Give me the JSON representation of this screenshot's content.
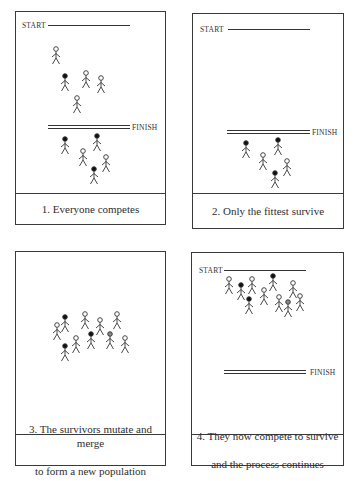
{
  "labels": {
    "start": "START",
    "finish": "FINISH"
  },
  "panels": [
    {
      "caption": "1. Everyone competes",
      "box": {
        "x": 15,
        "y": 11,
        "w": 151,
        "h": 214
      },
      "caption_top": 181,
      "start": {
        "x": 22,
        "y": 21,
        "line_x1": 48,
        "line_x2": 130,
        "line_y": 25
      },
      "finish": {
        "x": 132,
        "y": 123,
        "line_x1": 48,
        "line_x2": 130,
        "line_y": 125
      },
      "figures": [
        {
          "x": 56,
          "y": 49,
          "head": "open"
        },
        {
          "x": 65,
          "y": 76,
          "head": "filled"
        },
        {
          "x": 86,
          "y": 73,
          "head": "open"
        },
        {
          "x": 101,
          "y": 78,
          "head": "open"
        },
        {
          "x": 77,
          "y": 98,
          "head": "open"
        },
        {
          "x": 65,
          "y": 139,
          "head": "filled"
        },
        {
          "x": 97,
          "y": 136,
          "head": "filled"
        },
        {
          "x": 83,
          "y": 151,
          "head": "open"
        },
        {
          "x": 106,
          "y": 157,
          "head": "open"
        },
        {
          "x": 94,
          "y": 169,
          "head": "filled"
        }
      ]
    },
    {
      "caption": "2. Only the fittest survive",
      "box": {
        "x": 192,
        "y": 13,
        "w": 152,
        "h": 216
      },
      "caption_top": 179,
      "start": {
        "x": 200,
        "y": 25,
        "line_x1": 228,
        "line_x2": 310,
        "line_y": 29
      },
      "finish": {
        "x": 312,
        "y": 128,
        "line_x1": 227,
        "line_x2": 310,
        "line_y": 130
      },
      "figures": [
        {
          "x": 246,
          "y": 143,
          "head": "filled"
        },
        {
          "x": 278,
          "y": 140,
          "head": "filled"
        },
        {
          "x": 263,
          "y": 155,
          "head": "open"
        },
        {
          "x": 287,
          "y": 161,
          "head": "open"
        },
        {
          "x": 275,
          "y": 173,
          "head": "filled"
        }
      ]
    },
    {
      "caption": "3. The survivors mutate and merge to form a new population",
      "caption_lines": [
        "3. The survivors mutate and merge",
        "to form a new population"
      ],
      "box": {
        "x": 15,
        "y": 251,
        "w": 151,
        "h": 215
      },
      "caption_top": 182,
      "figures": [
        {
          "x": 57,
          "y": 325,
          "head": "open"
        },
        {
          "x": 65,
          "y": 317,
          "head": "filled"
        },
        {
          "x": 85,
          "y": 314,
          "head": "open"
        },
        {
          "x": 100,
          "y": 320,
          "head": "open"
        },
        {
          "x": 117,
          "y": 314,
          "head": "open"
        },
        {
          "x": 65,
          "y": 346,
          "head": "filled"
        },
        {
          "x": 76,
          "y": 338,
          "head": "open"
        },
        {
          "x": 91,
          "y": 334,
          "head": "filled"
        },
        {
          "x": 110,
          "y": 334,
          "head": "gray"
        },
        {
          "x": 125,
          "y": 338,
          "head": "open"
        }
      ]
    },
    {
      "caption": "4. They now compete to survive and the process continues",
      "caption_lines": [
        "4. They now compete to survive",
        "and the process continues"
      ],
      "box": {
        "x": 191,
        "y": 252,
        "w": 153,
        "h": 214
      },
      "caption_top": 181,
      "start": {
        "x": 199,
        "y": 266,
        "line_x1": 224,
        "line_x2": 306,
        "line_y": 270
      },
      "finish": {
        "x": 310,
        "y": 368,
        "line_x1": 224,
        "line_x2": 306,
        "line_y": 370
      },
      "figures": [
        {
          "x": 229,
          "y": 279,
          "head": "open"
        },
        {
          "x": 241,
          "y": 285,
          "head": "filled"
        },
        {
          "x": 252,
          "y": 279,
          "head": "open"
        },
        {
          "x": 273,
          "y": 276,
          "head": "filled"
        },
        {
          "x": 293,
          "y": 283,
          "head": "open"
        },
        {
          "x": 249,
          "y": 299,
          "head": "filled"
        },
        {
          "x": 264,
          "y": 290,
          "head": "open"
        },
        {
          "x": 279,
          "y": 297,
          "head": "open"
        },
        {
          "x": 288,
          "y": 302,
          "head": "gray"
        },
        {
          "x": 300,
          "y": 296,
          "head": "open"
        }
      ]
    }
  ],
  "colors": {
    "stroke": "#333333",
    "filled_head": "#111111",
    "gray_head": "#888888"
  }
}
